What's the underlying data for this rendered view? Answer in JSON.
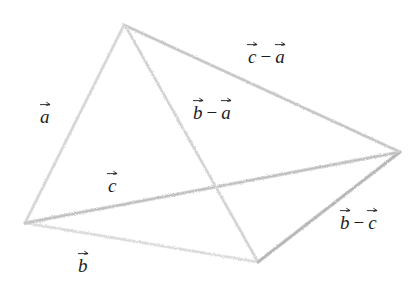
{
  "figure": {
    "background_color": "#ffffff",
    "edge_color_light": "#dcdcdc",
    "edge_color_mid": "#c9c9c9",
    "edge_color_dark": "#b0b0b0",
    "label_color": "#1d1d1d",
    "vertices": [
      {
        "name": "apex",
        "id": "A",
        "x": 124,
        "y": 25
      },
      {
        "name": "origin",
        "id": "O",
        "x": 25,
        "y": 223
      },
      {
        "name": "right",
        "id": "C",
        "x": 400,
        "y": 152
      },
      {
        "name": "bottom",
        "id": "B",
        "x": 258,
        "y": 262
      }
    ],
    "edges": [
      {
        "name": "edge-a",
        "from": "O",
        "to": "A",
        "label_key": "a"
      },
      {
        "name": "edge-b",
        "from": "O",
        "to": "B",
        "label_key": "b"
      },
      {
        "name": "edge-c",
        "from": "O",
        "to": "C",
        "label_key": "c"
      },
      {
        "name": "edge-c-minus-a",
        "from": "A",
        "to": "C",
        "label_key": "c_minus_a"
      },
      {
        "name": "edge-b-minus-a",
        "from": "A",
        "to": "B",
        "label_key": "b_minus_a"
      },
      {
        "name": "edge-b-minus-c",
        "from": "C",
        "to": "B",
        "label_key": "b_minus_c"
      }
    ]
  },
  "labels": {
    "a": {
      "base": "a",
      "arrow": "vector-arrow"
    },
    "b": {
      "base": "b",
      "arrow": "vector-arrow"
    },
    "c": {
      "base": "c",
      "arrow": "vector-arrow"
    },
    "c_minus_a": {
      "left": "c",
      "op": "−",
      "right": "a"
    },
    "b_minus_a": {
      "left": "b",
      "op": "−",
      "right": "a"
    },
    "b_minus_c": {
      "left": "b",
      "op": "−",
      "right": "c"
    }
  }
}
